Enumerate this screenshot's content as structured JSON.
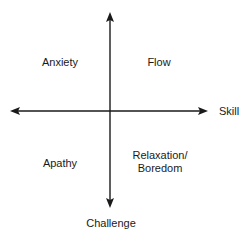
{
  "diagram": {
    "type": "quadrant",
    "axes": {
      "horizontal": {
        "label": "Skill",
        "bidirectional": true
      },
      "vertical": {
        "label": "Challenge",
        "bidirectional": true
      }
    },
    "quadrants": {
      "top_left": {
        "label": "Anxiety"
      },
      "top_right": {
        "label": "Flow"
      },
      "bottom_left": {
        "label": "Apathy"
      },
      "bottom_right": {
        "line1": "Relaxation/",
        "line2": "Boredom"
      }
    },
    "colors": {
      "axis": "#1a1a1a",
      "text": "#1a1a1a",
      "background": "#ffffff"
    }
  }
}
